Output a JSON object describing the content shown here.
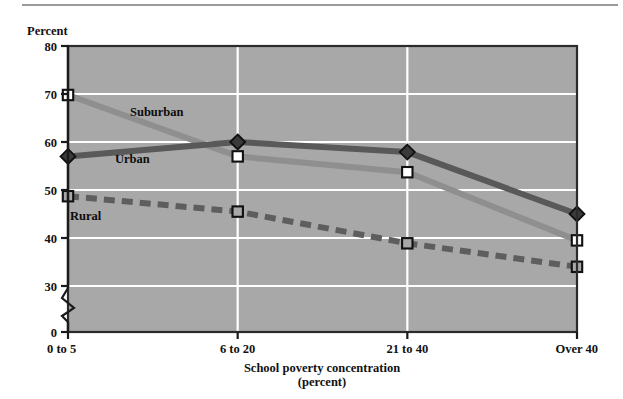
{
  "figure": {
    "background_color": "#ffffff",
    "plot_background_color": "#a8a8a8",
    "gridline_color": "#ffffff",
    "frame_color": "#2b2b2b",
    "has_top_rule": true,
    "axis_break": true
  },
  "chart_data": {
    "type": "line",
    "title": "",
    "subtitle": "",
    "xlabel": "School poverty concentration",
    "xlabel_sub": "(percent)",
    "ylabel": "Percent",
    "categories": [
      "0 to 5",
      "6 to 20",
      "21 to 40",
      "Over 40"
    ],
    "ytick_labels": [
      "80",
      "70",
      "60",
      "50",
      "40",
      "30",
      "0"
    ],
    "ytick_values": [
      80,
      70,
      60,
      50,
      40,
      30,
      0
    ],
    "ylim": [
      0,
      80
    ],
    "axis_break_between": [
      0,
      30
    ],
    "grid": "horizontal-and-vertical",
    "legend_position": "inline-labels",
    "series": [
      {
        "name": "Suburban",
        "label": "Suburban",
        "color": "#8f8f8f",
        "marker": "open-square",
        "marker_fill": "#ffffff",
        "linestyle": "solid",
        "values": [
          69.8,
          57.0,
          53.7,
          39.5
        ]
      },
      {
        "name": "Urban",
        "label": "Urban",
        "color": "#595959",
        "marker": "diamond",
        "marker_fill": "#3a3a3a",
        "linestyle": "solid",
        "values": [
          57.0,
          60.0,
          57.9,
          45.0
        ]
      },
      {
        "name": "Rural",
        "label": "Rural",
        "color": "#5e5e5e",
        "marker": "square",
        "marker_fill": "#a8a8a8",
        "linestyle": "dashed",
        "values": [
          48.7,
          45.5,
          38.9,
          34.0
        ]
      }
    ]
  }
}
